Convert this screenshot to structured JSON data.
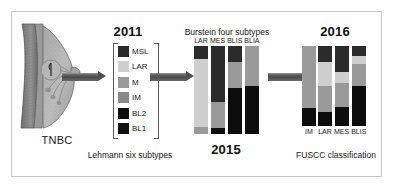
{
  "figure": {
    "title_left_label": "TNBC",
    "background": "#ffffff",
    "frame_border": "#c8c8c8"
  },
  "palette": {
    "dark": "#2b2b2b",
    "black": "#0d0d0d",
    "light_gray": "#cfcfcf",
    "mid_gray": "#9a9a9a",
    "mid_dark_gray": "#8a8a8a",
    "arrow": "#4f4f4f",
    "text": "#1a1a1a"
  },
  "anatomy": {
    "name": "breast-cross-section",
    "label": "TNBC"
  },
  "stage_2011": {
    "year": "2011",
    "caption": "Lehmann six subtypes",
    "legend": [
      {
        "label": "MSL",
        "color": "#2b2b2b"
      },
      {
        "label": "LAR",
        "color": "#cfcfcf"
      },
      {
        "label": "M",
        "color": "#9a9a9a"
      },
      {
        "label": "IM",
        "color": "#8a8a8a"
      },
      {
        "label": "BL2",
        "color": "#0d0d0d"
      },
      {
        "label": "BL1",
        "color": "#121212"
      }
    ]
  },
  "stage_2015": {
    "year": "2015",
    "caption": "Burstein four subtypes",
    "bars": [
      {
        "label": "LAR",
        "segments": [
          {
            "color": "#2b2b2b",
            "pct": 15
          },
          {
            "color": "#cfcfcf",
            "pct": 77
          },
          {
            "color": "#9a9a9a",
            "pct": 8
          }
        ]
      },
      {
        "label": "MES",
        "segments": [
          {
            "color": "#2b2b2b",
            "pct": 64
          },
          {
            "color": "#9a9a9a",
            "pct": 29
          },
          {
            "color": "#0d0d0d",
            "pct": 7
          }
        ]
      },
      {
        "label": "BLIS",
        "segments": [
          {
            "color": "#2b2b2b",
            "pct": 18
          },
          {
            "color": "#9a9a9a",
            "pct": 30
          },
          {
            "color": "#0d0d0d",
            "pct": 52
          }
        ]
      },
      {
        "label": "BLIA",
        "segments": [
          {
            "color": "#9a9a9a",
            "pct": 45
          },
          {
            "color": "#0d0d0d",
            "pct": 55
          }
        ]
      }
    ]
  },
  "stage_2016": {
    "year": "2016",
    "caption": "FUSCC classification",
    "bars": [
      {
        "label": "IM",
        "segments": [
          {
            "color": "#9a9a9a",
            "pct": 78
          },
          {
            "color": "#0d0d0d",
            "pct": 22
          }
        ]
      },
      {
        "label": "LAR",
        "segments": [
          {
            "color": "#2b2b2b",
            "pct": 20
          },
          {
            "color": "#cfcfcf",
            "pct": 30
          },
          {
            "color": "#9a9a9a",
            "pct": 33
          },
          {
            "color": "#0d0d0d",
            "pct": 17
          }
        ]
      },
      {
        "label": "MES",
        "segments": [
          {
            "color": "#2b2b2b",
            "pct": 33
          },
          {
            "color": "#cfcfcf",
            "pct": 13
          },
          {
            "color": "#9a9a9a",
            "pct": 30
          },
          {
            "color": "#0d0d0d",
            "pct": 24
          }
        ]
      },
      {
        "label": "BLIS",
        "segments": [
          {
            "color": "#2b2b2b",
            "pct": 13
          },
          {
            "color": "#cfcfcf",
            "pct": 10
          },
          {
            "color": "#9a9a9a",
            "pct": 27
          },
          {
            "color": "#0d0d0d",
            "pct": 50
          }
        ]
      }
    ]
  },
  "arrows": [
    {
      "name": "arrow-tnbc-to-lehmann"
    },
    {
      "name": "arrow-lehmann-to-burstein"
    },
    {
      "name": "arrow-burstein-to-fuscc"
    }
  ],
  "chart_data": {
    "type": "bar",
    "xlabel": "",
    "ylabel": "Proportion of cases (%)",
    "ylim": [
      0,
      100
    ],
    "grid": false,
    "legend_position": "left-panel",
    "panels": [
      {
        "name": "Lehmann six subtypes",
        "year": "2011",
        "type": "legend",
        "categories": [
          "MSL",
          "LAR",
          "M",
          "IM",
          "BL2",
          "BL1"
        ]
      },
      {
        "name": "Burstein four subtypes",
        "year": "2015",
        "type": "stacked-bar",
        "categories": [
          "LAR",
          "MES",
          "BLIS",
          "BLIA"
        ],
        "series": [
          {
            "name": "dark",
            "values": [
              15,
              64,
              18,
              0
            ]
          },
          {
            "name": "light-gray",
            "values": [
              77,
              0,
              0,
              0
            ]
          },
          {
            "name": "mid-gray",
            "values": [
              8,
              29,
              30,
              45
            ]
          },
          {
            "name": "black",
            "values": [
              0,
              7,
              52,
              55
            ]
          }
        ]
      },
      {
        "name": "FUSCC classification",
        "year": "2016",
        "type": "stacked-bar",
        "categories": [
          "IM",
          "LAR",
          "MES",
          "BLIS"
        ],
        "series": [
          {
            "name": "dark",
            "values": [
              0,
              20,
              33,
              13
            ]
          },
          {
            "name": "light-gray",
            "values": [
              0,
              30,
              13,
              10
            ]
          },
          {
            "name": "mid-gray",
            "values": [
              78,
              33,
              30,
              27
            ]
          },
          {
            "name": "black",
            "values": [
              22,
              17,
              24,
              50
            ]
          }
        ]
      }
    ]
  }
}
